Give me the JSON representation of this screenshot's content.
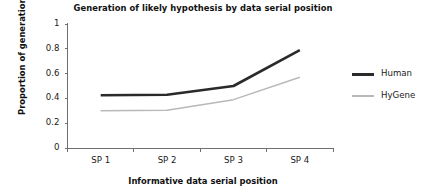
{
  "chart_data": {
    "type": "line",
    "title": "Generation of likely hypothesis by data serial position",
    "xlabel": "Informative data serial position",
    "ylabel": "Proportion of generation",
    "categories": [
      "SP 1",
      "SP 2",
      "SP 3",
      "SP 4"
    ],
    "ytick_labels": [
      "0",
      "0.2",
      "0.4",
      "0.6",
      "0.8",
      "1"
    ],
    "ytick_values": [
      0,
      0.2,
      0.4,
      0.6,
      0.8,
      1
    ],
    "ylim": [
      0,
      1
    ],
    "grid": false,
    "legend_position": "right",
    "series": [
      {
        "name": "Human",
        "values": [
          0.425,
          0.43,
          0.5,
          0.79
        ],
        "color": "#2a2a2a",
        "line_width": 2.6
      },
      {
        "name": "HyGene",
        "values": [
          0.3,
          0.305,
          0.39,
          0.57
        ],
        "color": "#b8b8b8",
        "line_width": 1.5
      }
    ]
  },
  "legend": {
    "entries": [
      {
        "label": "Human"
      },
      {
        "label": "HyGene"
      }
    ]
  },
  "axes": {
    "spine_color": "#6f6f6f",
    "tick_color": "#6f6f6f"
  }
}
